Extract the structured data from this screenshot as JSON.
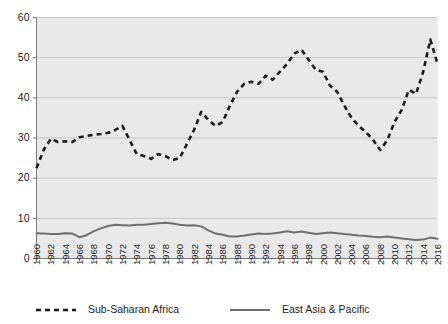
{
  "chart_data": {
    "type": "line",
    "title": "",
    "subtitle": "",
    "xlabel": "",
    "ylabel": "",
    "ylim": [
      0,
      60
    ],
    "xlim": [
      1960,
      2016
    ],
    "yticks": [
      0,
      10,
      20,
      30,
      40,
      50,
      60
    ],
    "grid": true,
    "legend_position": "bottom",
    "xticks": [
      1960,
      1962,
      1964,
      1966,
      1968,
      1970,
      1972,
      1974,
      1976,
      1978,
      1980,
      1982,
      1984,
      1986,
      1988,
      1990,
      1992,
      1994,
      1996,
      1998,
      2000,
      2002,
      2004,
      2006,
      2008,
      2010,
      2012,
      2014,
      2016
    ],
    "x": [
      1960,
      1961,
      1962,
      1963,
      1964,
      1965,
      1966,
      1967,
      1968,
      1969,
      1970,
      1971,
      1972,
      1973,
      1974,
      1975,
      1976,
      1977,
      1978,
      1979,
      1980,
      1981,
      1982,
      1983,
      1984,
      1985,
      1986,
      1987,
      1988,
      1989,
      1990,
      1991,
      1992,
      1993,
      1994,
      1995,
      1996,
      1997,
      1998,
      1999,
      2000,
      2001,
      2002,
      2003,
      2004,
      2005,
      2006,
      2007,
      2008,
      2009,
      2010,
      2011,
      2012,
      2013,
      2014,
      2015,
      2016
    ],
    "series": [
      {
        "name": "Sub-Saharan Africa",
        "style": "dashed",
        "color": "#1a1a1a",
        "values": [
          22.5,
          27.0,
          29.8,
          29.0,
          29.2,
          29.0,
          30.2,
          30.5,
          30.8,
          31.0,
          31.3,
          32.0,
          33.0,
          29.5,
          26.0,
          25.5,
          24.8,
          26.0,
          25.5,
          24.5,
          25.0,
          28.5,
          32.0,
          36.5,
          34.5,
          33.0,
          34.0,
          38.0,
          41.5,
          43.5,
          44.0,
          43.5,
          45.5,
          44.5,
          46.5,
          48.5,
          51.0,
          52.0,
          49.5,
          47.0,
          46.5,
          43.0,
          41.5,
          38.0,
          35.0,
          33.0,
          31.5,
          29.5,
          27.0,
          29.5,
          34.0,
          37.0,
          42.0,
          41.0,
          46.5,
          54.5,
          48.5
        ]
      },
      {
        "name": "East Asia & Pacific",
        "style": "solid",
        "color": "#6e6e6e",
        "values": [
          6.3,
          6.2,
          6.1,
          6.1,
          6.3,
          6.2,
          5.3,
          5.8,
          6.8,
          7.5,
          8.1,
          8.4,
          8.3,
          8.2,
          8.4,
          8.4,
          8.6,
          8.8,
          8.9,
          8.7,
          8.4,
          8.2,
          8.3,
          8.0,
          7.0,
          6.2,
          5.9,
          5.5,
          5.5,
          5.7,
          6.0,
          6.2,
          6.1,
          6.2,
          6.5,
          6.8,
          6.5,
          6.7,
          6.4,
          6.1,
          6.3,
          6.5,
          6.3,
          6.1,
          5.9,
          5.7,
          5.6,
          5.4,
          5.3,
          5.5,
          5.2,
          5.0,
          4.8,
          4.6,
          4.7,
          5.2,
          4.9
        ]
      }
    ]
  },
  "legend": {
    "items": [
      {
        "label": "Sub-Saharan Africa",
        "style": "dashed"
      },
      {
        "label": "East Asia & Pacific",
        "style": "solid"
      }
    ]
  },
  "colors": {
    "plot_background": "#e9e9e9",
    "gridline": "#b9b9b9",
    "axis": "#6d6d6d",
    "series_dashed": "#1a1a1a",
    "series_solid": "#6e6e6e",
    "text": "#231f20"
  }
}
